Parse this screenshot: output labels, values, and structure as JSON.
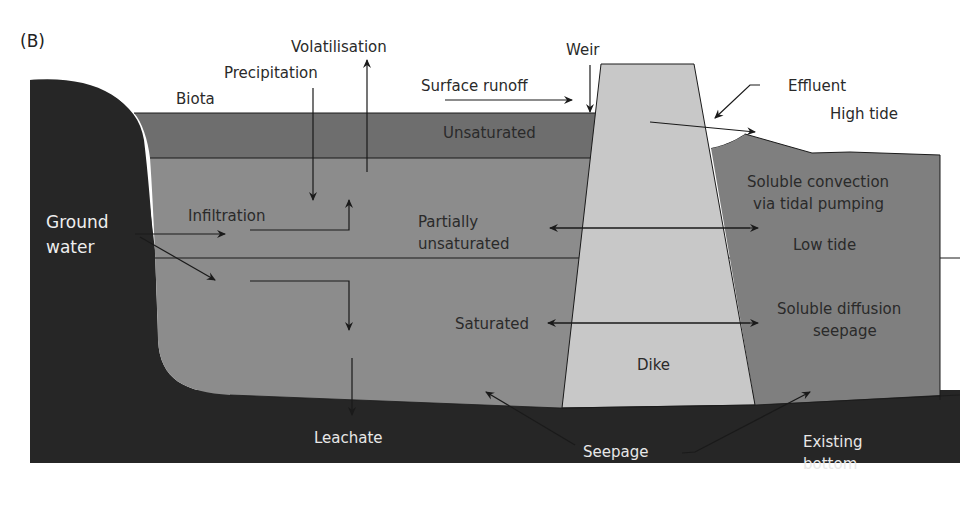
{
  "panel_label": "(B)",
  "colors": {
    "background": "#ffffff",
    "ground": "#262626",
    "unsaturated": "#6e6e6e",
    "pond": "#8c8c8c",
    "dike": "#c8c8c8",
    "sea": "#7f7f7f",
    "line": "#1a1a1a"
  },
  "labels": {
    "volatilisation": "Volatilisation",
    "precipitation": "Precipitation",
    "biota": "Biota",
    "surface_runoff": "Surface runoff",
    "weir": "Weir",
    "effluent": "Effluent",
    "high_tide": "High tide",
    "unsaturated": "Unsaturated",
    "ground_water_1": "Ground",
    "ground_water_2": "water",
    "infiltration": "Infiltration",
    "partially_1": "Partially",
    "partially_2": "unsaturated",
    "soluble_convection_1": "Soluble convection",
    "soluble_convection_2": "via tidal pumping",
    "low_tide": "Low tide",
    "saturated": "Saturated",
    "soluble_diffusion_1": "Soluble diffusion",
    "soluble_diffusion_2": "seepage",
    "dike": "Dike",
    "leachate": "Leachate",
    "seepage": "Seepage",
    "existing_bottom_1": "Existing",
    "existing_bottom_2": "bottom"
  }
}
